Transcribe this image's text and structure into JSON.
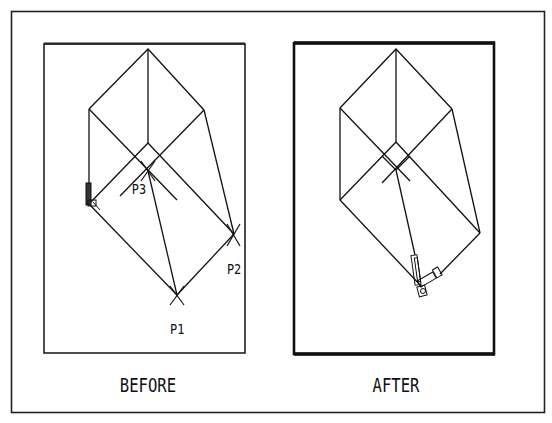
{
  "figure": {
    "panels": [
      {
        "caption": "BEFORE",
        "points": [
          {
            "label": "P1"
          },
          {
            "label": "P2"
          },
          {
            "label": "P3"
          }
        ]
      },
      {
        "caption": "AFTER"
      }
    ]
  },
  "colors": {
    "line": "#111111",
    "background": "#ffffff"
  }
}
